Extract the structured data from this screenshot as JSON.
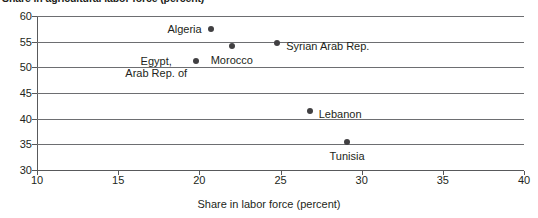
{
  "chart_data": {
    "type": "scatter",
    "title": "Share in agricultural labor force (percent)",
    "xlabel": "Share in labor force (percent)",
    "ylabel": "",
    "xlim": [
      10,
      40
    ],
    "ylim": [
      30,
      60
    ],
    "xticks": [
      "10",
      "15",
      "20",
      "25",
      "30",
      "35",
      "40"
    ],
    "yticks": [
      "30",
      "35",
      "40",
      "45",
      "50",
      "55",
      "60"
    ],
    "grid": true,
    "legend": "none",
    "point_color": "#414042",
    "grid_color": "#6d6e71",
    "text_color": "#231f20",
    "points": [
      {
        "label": "Algeria",
        "label_line2": "",
        "x": 20.7,
        "y": 57.5,
        "label_pos": "left"
      },
      {
        "label": "Morocco",
        "label_line2": "",
        "x": 22.0,
        "y": 54.2,
        "label_pos": "below"
      },
      {
        "label": "Syrian Arab Rep.",
        "label_line2": "",
        "x": 24.8,
        "y": 54.8,
        "label_pos": "right"
      },
      {
        "label": "Egypt,",
        "label_line2": "Arab Rep. of",
        "x": 19.8,
        "y": 51.2,
        "label_pos": "left"
      },
      {
        "label": "Lebanon",
        "label_line2": "",
        "x": 26.8,
        "y": 41.5,
        "label_pos": "right"
      },
      {
        "label": "Tunisia",
        "label_line2": "",
        "x": 29.1,
        "y": 35.5,
        "label_pos": "below"
      }
    ]
  }
}
